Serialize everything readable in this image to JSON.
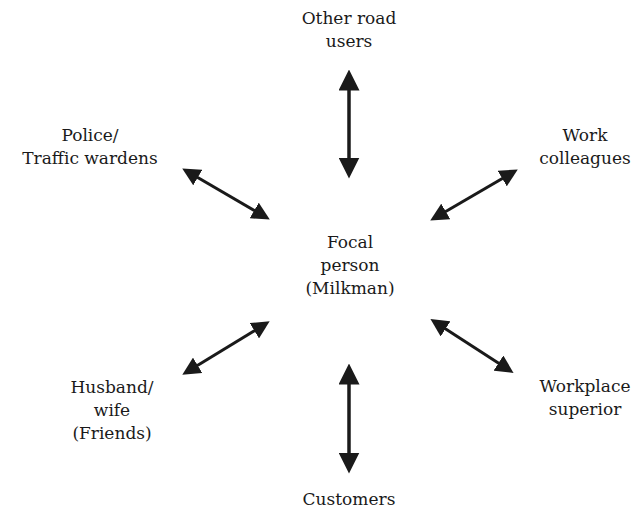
{
  "diagram": {
    "type": "role-set",
    "center": {
      "lines": [
        "Focal",
        "person",
        "(Milkman)"
      ]
    },
    "nodes": [
      {
        "id": "other-road-users",
        "lines": [
          "Other road",
          "users"
        ]
      },
      {
        "id": "police",
        "lines": [
          "Police/",
          "Traffic wardens"
        ]
      },
      {
        "id": "work-colleagues",
        "lines": [
          "Work",
          "colleagues"
        ]
      },
      {
        "id": "husband-wife",
        "lines": [
          "Husband/",
          "wife",
          "(Friends)"
        ]
      },
      {
        "id": "workplace-superior",
        "lines": [
          "Workplace",
          "superior"
        ]
      },
      {
        "id": "customers",
        "lines": [
          "Customers"
        ]
      }
    ],
    "edges": [
      {
        "from": "center",
        "to": "other-road-users",
        "style": "double-arrow"
      },
      {
        "from": "center",
        "to": "police",
        "style": "double-arrow"
      },
      {
        "from": "center",
        "to": "work-colleagues",
        "style": "double-arrow"
      },
      {
        "from": "center",
        "to": "husband-wife",
        "style": "double-arrow"
      },
      {
        "from": "center",
        "to": "workplace-superior",
        "style": "double-arrow"
      },
      {
        "from": "center",
        "to": "customers",
        "style": "double-arrow"
      }
    ],
    "colors": {
      "ink": "#1a1a1a",
      "background": "#ffffff"
    }
  }
}
